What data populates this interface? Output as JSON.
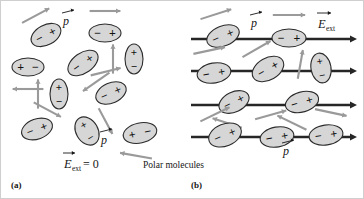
{
  "figure": {
    "background": "#ffffff",
    "molecule_fill": "#d6d6d6",
    "molecule_stroke": "#2b2b2b",
    "dipole_arrow_color": "#9a9a9a",
    "field_line_color": "#262626",
    "width": 364,
    "height": 199
  },
  "panel_a": {
    "key": "(a)",
    "caption": "E_ext = 0",
    "caption_symbol": "E",
    "caption_subscript": "ext",
    "caption_rest": " = 0",
    "dipole_label_top": "p",
    "dipole_label_bottom": "p",
    "molecules": [
      {
        "id": "a1",
        "cx": 45,
        "cy": 34,
        "rx": 16,
        "ry": 10,
        "angle": -28,
        "sign_first": "−",
        "sign_second": "+",
        "arrow_angle": -28
      },
      {
        "id": "a2",
        "cx": 104,
        "cy": 32,
        "rx": 16,
        "ry": 9,
        "angle": 0,
        "sign_first": "−",
        "sign_second": "+",
        "arrow_angle": 0
      },
      {
        "id": "a3",
        "cx": 27,
        "cy": 66,
        "rx": 16,
        "ry": 9,
        "angle": 0,
        "sign_first": "+",
        "sign_second": "−",
        "arrow_angle": 180
      },
      {
        "id": "a4",
        "cx": 82,
        "cy": 62,
        "rx": 17,
        "ry": 10,
        "angle": -35,
        "sign_first": "−",
        "sign_second": "+",
        "arrow_angle": 145
      },
      {
        "id": "a5",
        "cx": 133,
        "cy": 58,
        "rx": 9,
        "ry": 15,
        "angle": 0,
        "sign_first": "+",
        "sign_second": "−",
        "arrow_angle": -90
      },
      {
        "id": "a6",
        "cx": 58,
        "cy": 93,
        "rx": 9,
        "ry": 15,
        "angle": 0,
        "sign_first": "+",
        "sign_second": "−",
        "arrow_angle": -90
      },
      {
        "id": "a7",
        "cx": 110,
        "cy": 92,
        "rx": 16,
        "ry": 10,
        "angle": -24,
        "sign_first": "−",
        "sign_second": "+",
        "arrow_angle": -14
      },
      {
        "id": "a8",
        "cx": 36,
        "cy": 128,
        "rx": 16,
        "ry": 10,
        "angle": -20,
        "sign_first": "−",
        "sign_second": "+",
        "arrow_angle": 28
      },
      {
        "id": "a9",
        "cx": 86,
        "cy": 130,
        "rx": 11,
        "ry": 15,
        "angle": -30,
        "sign_first": "+",
        "sign_second": "−",
        "arrow_angle": 62
      },
      {
        "id": "a10",
        "cx": 139,
        "cy": 132,
        "rx": 17,
        "ry": 10,
        "angle": -12,
        "sign_first": "+",
        "sign_second": "−",
        "arrow_angle": 190
      }
    ]
  },
  "panel_b": {
    "key": "(b)",
    "caption": "Polar molecules",
    "field_label_symbol": "E",
    "field_label_subscript": "ext",
    "dipole_label_top": "p",
    "dipole_label_bottom": "p",
    "field_lines": [
      {
        "id": "line1",
        "y": 38,
        "x_start": 190,
        "x_end": 356
      },
      {
        "id": "line2",
        "y": 70,
        "x_start": 190,
        "x_end": 356
      },
      {
        "id": "line3",
        "y": 104,
        "x_start": 190,
        "x_end": 356
      },
      {
        "id": "line4",
        "y": 136,
        "x_start": 190,
        "x_end": 356
      }
    ],
    "molecules": [
      {
        "id": "b1",
        "cx": 222,
        "cy": 35,
        "rx": 17,
        "ry": 10,
        "angle": -22,
        "sign_first": "−",
        "sign_second": "+",
        "arrow_angle": -18
      },
      {
        "id": "b2",
        "cx": 288,
        "cy": 37,
        "rx": 17,
        "ry": 9,
        "angle": 0,
        "sign_first": "−",
        "sign_second": "+",
        "arrow_angle": 0
      },
      {
        "id": "b3",
        "cx": 213,
        "cy": 72,
        "rx": 17,
        "ry": 10,
        "angle": -10,
        "sign_first": "−",
        "sign_second": "+",
        "arrow_angle": -12
      },
      {
        "id": "b4",
        "cx": 267,
        "cy": 68,
        "rx": 17,
        "ry": 11,
        "angle": -30,
        "sign_first": "−",
        "sign_second": "+",
        "arrow_angle": -30
      },
      {
        "id": "b5",
        "cx": 320,
        "cy": 67,
        "rx": 10,
        "ry": 15,
        "angle": -10,
        "sign_first": "+",
        "sign_second": "−",
        "arrow_angle": -80
      },
      {
        "id": "b6",
        "cx": 233,
        "cy": 101,
        "rx": 16,
        "ry": 10,
        "angle": -26,
        "sign_first": "−",
        "sign_second": "+",
        "arrow_angle": 198
      },
      {
        "id": "b7",
        "cx": 301,
        "cy": 101,
        "rx": 17,
        "ry": 10,
        "angle": -16,
        "sign_first": "−",
        "sign_second": "+",
        "arrow_angle": 206
      },
      {
        "id": "b8",
        "cx": 224,
        "cy": 134,
        "rx": 17,
        "ry": 11,
        "angle": -22,
        "sign_first": "−",
        "sign_second": "+",
        "arrow_angle": -26
      },
      {
        "id": "b9",
        "cx": 276,
        "cy": 136,
        "rx": 17,
        "ry": 10,
        "angle": -10,
        "sign_first": "−",
        "sign_second": "+",
        "arrow_angle": -16
      },
      {
        "id": "b10",
        "cx": 325,
        "cy": 134,
        "rx": 17,
        "ry": 10,
        "angle": -8,
        "sign_first": "−",
        "sign_second": "+",
        "arrow_angle": 12
      }
    ]
  }
}
